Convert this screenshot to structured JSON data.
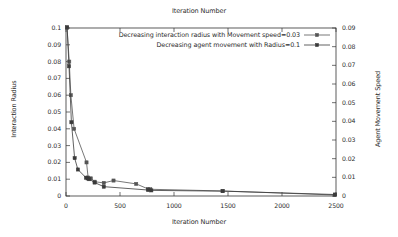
{
  "chart_data": {
    "type": "line",
    "title": "Iteration Number",
    "xlabel": "Iteration Number",
    "ylabel": "Interaction Radius",
    "ylabel_right": "Agent Movement Speed",
    "xlim": [
      0,
      2500
    ],
    "ylim": [
      0,
      0.1
    ],
    "ylim_right": [
      0,
      0.09
    ],
    "grid": false,
    "legend_position": "top-center",
    "xticks": [
      0,
      500,
      1000,
      1500,
      2000,
      2500
    ],
    "xticklabels": [
      "0",
      "500",
      "1000",
      "1500",
      "2000",
      "2500"
    ],
    "yticks_left": [
      0,
      0.01,
      0.02,
      0.03,
      0.04,
      0.05,
      0.06,
      0.07,
      0.08,
      0.09,
      0.1
    ],
    "yticklabels_left": [
      "0",
      "0.01",
      "0.02",
      "0.03",
      "0.04",
      "0.05",
      "0.06",
      "0.07",
      "0.08",
      "0.09",
      "0.1"
    ],
    "yticks_right": [
      0,
      0.01,
      0.02,
      0.03,
      0.04,
      0.05,
      0.06,
      0.07,
      0.08,
      0.09
    ],
    "yticklabels_right": [
      "0",
      "0.01",
      "0.02",
      "0.03",
      "0.04",
      "0.05",
      "0.06",
      "0.07",
      "0.08",
      "0.09"
    ],
    "series": [
      {
        "name": "Decreasing interaction radius with Movement speed=0.03",
        "axis": "left",
        "color": "#555555",
        "marker": "square",
        "x": [
          10,
          30,
          45,
          75,
          190,
          205,
          230,
          265,
          350,
          440,
          650,
          760,
          780,
          1450,
          2490
        ],
        "values": [
          0.1,
          0.08,
          0.06,
          0.04,
          0.02,
          0.011,
          0.0105,
          0.0085,
          0.0078,
          0.0092,
          0.0072,
          0.0042,
          0.004,
          0.003,
          0.0006
        ]
      },
      {
        "name": "Decreasing agent movement with Radius=0.1",
        "axis": "right",
        "color": "#3a3a3a",
        "marker": "square-filled",
        "x": [
          10,
          28,
          50,
          80,
          110,
          185,
          200,
          215,
          265,
          350,
          760,
          790,
          1450,
          2490
        ],
        "values": [
          0.0905,
          0.0695,
          0.0395,
          0.0203,
          0.0142,
          0.0098,
          0.0094,
          0.009,
          0.0072,
          0.005,
          0.0032,
          0.003,
          0.0026,
          0.0008
        ]
      }
    ],
    "legend": [
      {
        "label": "Decreasing interaction radius with Movement speed=0.03",
        "color": "#555555",
        "marker": "square"
      },
      {
        "label": "Decreasing agent movement with Radius=0.1",
        "color": "#3a3a3a",
        "marker": "square-filled"
      }
    ]
  }
}
